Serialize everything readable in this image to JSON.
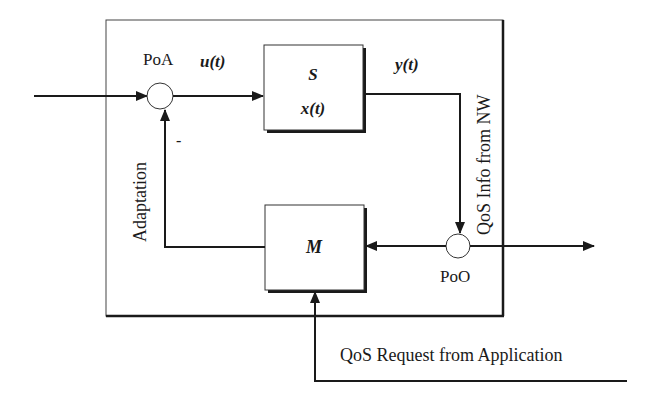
{
  "diagram": {
    "type": "control-loop-block-diagram",
    "colors": {
      "line": "#1a1a1a",
      "background": "#ffffff",
      "node_fill": "#ffffff"
    },
    "outer_box": {
      "x": 106,
      "y": 20,
      "w": 397,
      "h": 296
    },
    "blocks": {
      "s": {
        "label": "S",
        "sublabel": "x(t)",
        "x": 264,
        "y": 45,
        "w": 99,
        "h": 85
      },
      "m": {
        "label": "M",
        "x": 265,
        "y": 205,
        "w": 99,
        "h": 85
      }
    },
    "nodes": {
      "poa": {
        "label": "PoA",
        "cx": 160,
        "cy": 96,
        "r": 13
      },
      "poo": {
        "label": "PoO",
        "cx": 458,
        "cy": 246,
        "r": 12
      }
    },
    "signals": {
      "input_signal": "u(t)",
      "output_signal": "y(t)",
      "feedback_sign": "-"
    },
    "side_labels": {
      "adaptation": "Adaptation",
      "qos_info": "QoS Info from NW"
    },
    "bottom_label": "QoS Request from  Application"
  }
}
